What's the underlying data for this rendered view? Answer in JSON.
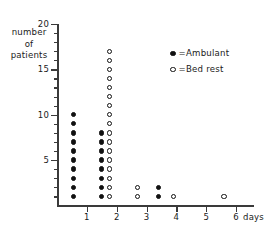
{
  "chart_data": {
    "type": "scatter",
    "title": "",
    "xlabel": "days",
    "ylabel": "number of patients",
    "xlim": [
      0,
      6.6
    ],
    "ylim": [
      0,
      20
    ],
    "grid": false,
    "legend_position": "top-right",
    "y_ticks_major": [
      5,
      10,
      15,
      20
    ],
    "y_ticks_minor": [
      1,
      2,
      3,
      4,
      6,
      7,
      8,
      9,
      11,
      12,
      13,
      14,
      16,
      17,
      18,
      19
    ],
    "x_ticks": [
      1,
      2,
      3,
      4,
      5,
      6
    ],
    "x_tick_labels": [
      "1",
      "2",
      "3",
      "4",
      "5",
      "6"
    ],
    "y_tick_labels": [
      "5",
      "10",
      "15",
      "20"
    ],
    "ylabel_lines": [
      "number",
      "of",
      "patients"
    ],
    "series": [
      {
        "name": "Ambulant",
        "marker": "filled-circle",
        "color": "#111111",
        "points": [
          {
            "x": 0.55,
            "y": 1
          },
          {
            "x": 0.55,
            "y": 2
          },
          {
            "x": 0.55,
            "y": 3
          },
          {
            "x": 0.55,
            "y": 4
          },
          {
            "x": 0.55,
            "y": 5
          },
          {
            "x": 0.55,
            "y": 6
          },
          {
            "x": 0.55,
            "y": 7
          },
          {
            "x": 0.55,
            "y": 8
          },
          {
            "x": 0.55,
            "y": 9
          },
          {
            "x": 0.55,
            "y": 10
          },
          {
            "x": 1.5,
            "y": 1
          },
          {
            "x": 1.5,
            "y": 2
          },
          {
            "x": 1.5,
            "y": 3
          },
          {
            "x": 1.5,
            "y": 4
          },
          {
            "x": 1.5,
            "y": 5
          },
          {
            "x": 1.5,
            "y": 6
          },
          {
            "x": 1.5,
            "y": 7
          },
          {
            "x": 1.5,
            "y": 8
          },
          {
            "x": 3.4,
            "y": 1
          },
          {
            "x": 3.4,
            "y": 2
          }
        ]
      },
      {
        "name": "Bed rest",
        "marker": "open-circle",
        "color": "#111111",
        "points": [
          {
            "x": 1.75,
            "y": 1
          },
          {
            "x": 1.75,
            "y": 2
          },
          {
            "x": 1.75,
            "y": 3
          },
          {
            "x": 1.75,
            "y": 4
          },
          {
            "x": 1.75,
            "y": 5
          },
          {
            "x": 1.75,
            "y": 6
          },
          {
            "x": 1.75,
            "y": 7
          },
          {
            "x": 1.75,
            "y": 8
          },
          {
            "x": 1.75,
            "y": 9
          },
          {
            "x": 1.75,
            "y": 10
          },
          {
            "x": 1.75,
            "y": 11
          },
          {
            "x": 1.75,
            "y": 12
          },
          {
            "x": 1.75,
            "y": 13
          },
          {
            "x": 1.75,
            "y": 14
          },
          {
            "x": 1.75,
            "y": 15
          },
          {
            "x": 1.75,
            "y": 16
          },
          {
            "x": 1.75,
            "y": 17
          },
          {
            "x": 2.7,
            "y": 1
          },
          {
            "x": 2.7,
            "y": 2
          },
          {
            "x": 3.9,
            "y": 1
          },
          {
            "x": 5.6,
            "y": 1
          }
        ]
      }
    ]
  },
  "legend": {
    "equals": "=",
    "entries": [
      {
        "label": "Ambulant",
        "marker": "filled-circle"
      },
      {
        "label": "Bed rest",
        "marker": "open-circle"
      }
    ]
  },
  "axis_unit_label": "days"
}
